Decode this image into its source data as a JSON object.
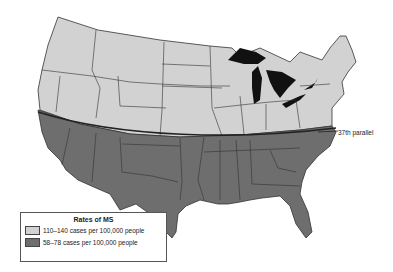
{
  "map": {
    "title": "Rates of MS in the United States",
    "parallel_label": "37th parallel",
    "colors": {
      "north_fill": "#d2d2d2",
      "south_fill": "#6e6e6e",
      "lakes_fill": "#111111",
      "border": "#333333"
    }
  },
  "legend": {
    "title": "Rates of MS",
    "items": [
      {
        "label": "110–140 cases per 100,000 people",
        "color": "#d2d2d2"
      },
      {
        "label": "58–78 cases per 100,000 people",
        "color": "#6e6e6e"
      }
    ]
  }
}
